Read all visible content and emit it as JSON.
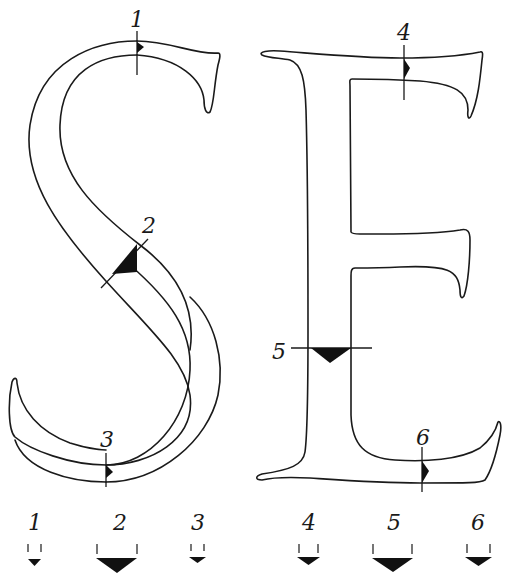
{
  "figure": {
    "letters": [
      "S",
      "E"
    ],
    "stroke_color": "#1a1a1a",
    "fill_color": "#111111",
    "background": "#ffffff"
  },
  "markers": [
    {
      "id": "1",
      "label": "1",
      "letter": "S",
      "position": "top curve",
      "nib_size": "small"
    },
    {
      "id": "2",
      "label": "2",
      "letter": "S",
      "position": "diagonal spine",
      "nib_size": "large"
    },
    {
      "id": "3",
      "label": "3",
      "letter": "S",
      "position": "bottom curve",
      "nib_size": "small"
    },
    {
      "id": "4",
      "label": "4",
      "letter": "E",
      "position": "top arm",
      "nib_size": "medium"
    },
    {
      "id": "5",
      "label": "5",
      "letter": "E",
      "position": "vertical stem",
      "nib_size": "large"
    },
    {
      "id": "6",
      "label": "6",
      "letter": "E",
      "position": "bottom arm",
      "nib_size": "medium"
    }
  ],
  "legend": {
    "items": [
      {
        "label": "1",
        "nib_size": "small"
      },
      {
        "label": "2",
        "nib_size": "large"
      },
      {
        "label": "3",
        "nib_size": "small"
      },
      {
        "label": "4",
        "nib_size": "medium"
      },
      {
        "label": "5",
        "nib_size": "large"
      },
      {
        "label": "6",
        "nib_size": "medium"
      }
    ]
  }
}
